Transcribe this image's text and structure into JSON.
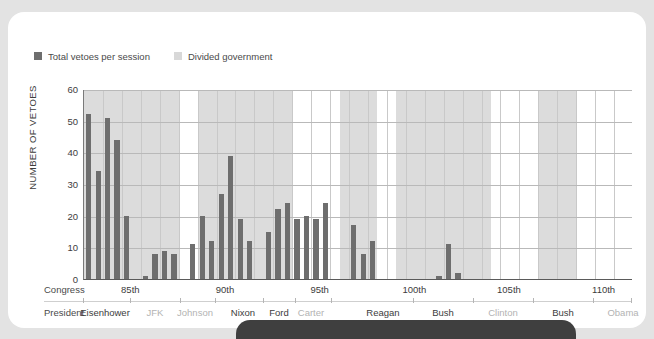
{
  "legend": {
    "items": [
      {
        "label": "Total vetoes per session",
        "color": "#6e6e6e",
        "name": "legend-total-vetoes"
      },
      {
        "label": "Divided government",
        "color": "#d8d8d8",
        "name": "legend-divided-government"
      }
    ]
  },
  "axis": {
    "ylabel": "NUMBER OF VETOES",
    "yticks": [
      "60",
      "50",
      "40",
      "30",
      "20",
      "10",
      "0"
    ]
  },
  "rows": {
    "congress_label": "Congress",
    "president_label": "President"
  },
  "chart_data": {
    "type": "bar",
    "title": "",
    "xlabel": "Congress",
    "ylabel": "NUMBER OF VETOES",
    "ylim": [
      0,
      60
    ],
    "ytick_values": [
      0,
      10,
      20,
      30,
      40,
      50,
      60
    ],
    "grid": true,
    "legend_position": "top-left",
    "bar_color": "#6e6e6e",
    "shaded_band_color": "#dcdcdc",
    "shaded_band_meaning": "Divided government",
    "categories": [
      "83rd-1",
      "83rd-2",
      "84th-1",
      "84th-2",
      "85th-1",
      "85th-2",
      "86th-1",
      "86th-2",
      "87th-1",
      "87th-2",
      "88th-1",
      "88th-2",
      "89th-1",
      "89th-2",
      "90th-1",
      "90th-2",
      "91st-1",
      "91st-2",
      "92nd-1",
      "92nd-2",
      "93rd-1",
      "93rd-2",
      "94th-1",
      "94th-2",
      "95th-1",
      "95th-2",
      "96th-1",
      "96th-2",
      "97th-1",
      "97th-2",
      "98th-1",
      "98th-2",
      "99th-1",
      "99th-2",
      "100th-1",
      "100th-2",
      "101st-1",
      "101st-2",
      "102nd-1",
      "102nd-2",
      "103rd-1",
      "103rd-2",
      "104th-1",
      "104th-2",
      "105th-1",
      "105th-2",
      "106th-1",
      "106th-2",
      "107th-1",
      "107th-2",
      "108th-1",
      "108th-2",
      "109th-1",
      "109th-2",
      "110th-1",
      "110th-2",
      "111th-1",
      "111th-2"
    ],
    "values": [
      52,
      34,
      51,
      44,
      20,
      0,
      1,
      8,
      9,
      8,
      0,
      11,
      20,
      12,
      27,
      39,
      19,
      12,
      0,
      15,
      22,
      24,
      19,
      20,
      19,
      24,
      0,
      0,
      17,
      8,
      12,
      0,
      0,
      0,
      0,
      0,
      0,
      1,
      11,
      2,
      0,
      0,
      0,
      0,
      0,
      0,
      0,
      0,
      0,
      0,
      0,
      0,
      0,
      0,
      0,
      0,
      0,
      0
    ],
    "congress_ticks": [
      "85th",
      "90th",
      "95th",
      "100th",
      "105th",
      "110th"
    ],
    "presidents": [
      {
        "name": "Eisenhower",
        "divided": true
      },
      {
        "name": "JFK",
        "divided": false
      },
      {
        "name": "Johnson",
        "divided": false
      },
      {
        "name": "Nixon",
        "divided": true
      },
      {
        "name": "Ford",
        "divided": true
      },
      {
        "name": "Carter",
        "divided": false
      },
      {
        "name": "Reagan",
        "divided": true
      },
      {
        "name": "Bush",
        "divided": true
      },
      {
        "name": "Clinton",
        "divided": false
      },
      {
        "name": "Bush",
        "divided": true
      },
      {
        "name": "Obama",
        "divided": false
      }
    ]
  }
}
